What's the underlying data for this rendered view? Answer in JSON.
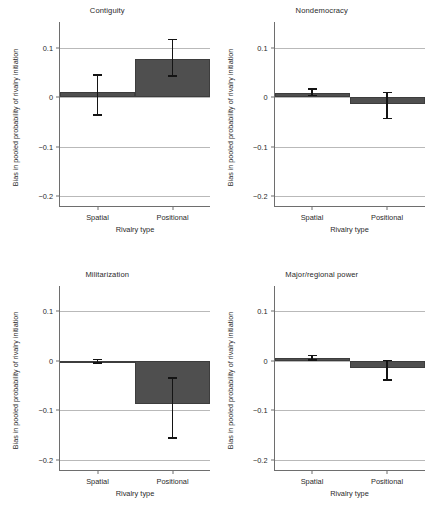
{
  "figure": {
    "background": "#ffffff",
    "bar_color": "#4f4f4f",
    "error_color": "#141414",
    "grid_color": "#b9b9b9",
    "axis_color": "#6e6e6e"
  },
  "chart_data": [
    {
      "type": "bar",
      "title": "Contiguity",
      "xlabel": "Rivalry type",
      "ylabel": "Bias in pooled probability of rivalry initiation",
      "categories": [
        "Spatial",
        "Positional"
      ],
      "values": [
        0.01,
        0.077
      ],
      "error_low": [
        -0.038,
        0.041
      ],
      "error_high": [
        0.046,
        0.118
      ],
      "ylim": [
        -0.22,
        0.14
      ],
      "yticks": [
        0.1,
        0,
        -0.1,
        -0.2
      ],
      "ytick_labels": [
        "0.1",
        "0",
        "−0.1",
        "−0.2"
      ],
      "grid": "horizontal",
      "legend": "none"
    },
    {
      "type": "bar",
      "title": "Nondemocracy",
      "xlabel": "Rivalry type",
      "ylabel": "Bias in pooled probability of rivalry initiation",
      "categories": [
        "Spatial",
        "Positional"
      ],
      "values": [
        0.008,
        -0.013
      ],
      "error_low": [
        0.002,
        -0.045
      ],
      "error_high": [
        0.018,
        0.011
      ],
      "ylim": [
        -0.22,
        0.14
      ],
      "yticks": [
        0.1,
        0,
        -0.1,
        -0.2
      ],
      "ytick_labels": [
        "0.1",
        "0",
        "−0.1",
        "−0.2"
      ],
      "grid": "horizontal",
      "legend": "none"
    },
    {
      "type": "bar",
      "title": "Militarization",
      "xlabel": "Rivalry type",
      "ylabel": "Bias in pooled probability of rivalry initiation",
      "categories": [
        "Spatial",
        "Positional"
      ],
      "values": [
        -0.002,
        -0.088
      ],
      "error_low": [
        -0.006,
        -0.158
      ],
      "error_high": [
        0.004,
        -0.033
      ],
      "ylim": [
        -0.22,
        0.14
      ],
      "yticks": [
        0.1,
        0,
        -0.1,
        -0.2
      ],
      "ytick_labels": [
        "0.1",
        "0",
        "−0.1",
        "−0.2"
      ],
      "grid": "horizontal",
      "legend": "none"
    },
    {
      "type": "bar",
      "title": "Major/regional power",
      "xlabel": "Rivalry type",
      "ylabel": "Bias in pooled probability of rivalry initiation",
      "categories": [
        "Spatial",
        "Positional"
      ],
      "values": [
        0.005,
        -0.014
      ],
      "error_low": [
        0.0,
        -0.041
      ],
      "error_high": [
        0.012,
        0.002
      ],
      "ylim": [
        -0.22,
        0.14
      ],
      "yticks": [
        0.1,
        0,
        -0.1,
        -0.2
      ],
      "ytick_labels": [
        "0.1",
        "0",
        "−0.1",
        "−0.2"
      ],
      "grid": "horizontal",
      "legend": "none"
    }
  ]
}
